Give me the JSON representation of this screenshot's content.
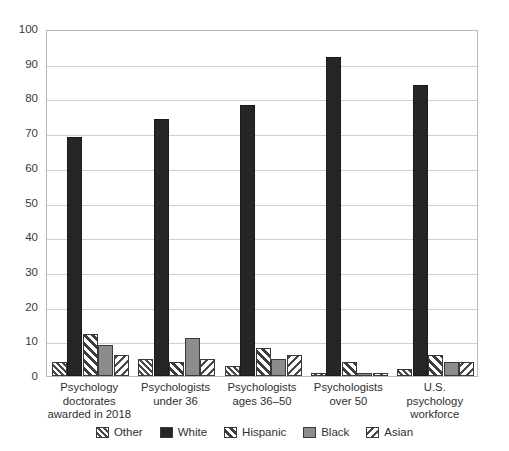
{
  "chart_data": {
    "type": "bar",
    "title": "",
    "subtitle": "",
    "xlabel": "",
    "ylabel": "",
    "ylim": [
      0,
      100
    ],
    "ytick_step": 10,
    "yticks": [
      "0",
      "10",
      "20",
      "30",
      "40",
      "50",
      "60",
      "70",
      "80",
      "90",
      "100"
    ],
    "grid": true,
    "legend_position": "bottom",
    "categories": [
      "Psychology\ndoctorates\nawarded in 2018",
      "Psychologists\nunder 36",
      "Psychologists\nages 36–50",
      "Psychologists\nover 50",
      "U.S.\npsychology\nworkforce"
    ],
    "series": [
      {
        "name": "Other",
        "pattern": "diagonal-hatch-forward",
        "color": "#9a9a9a",
        "values": [
          4,
          5,
          3,
          1,
          2
        ]
      },
      {
        "name": "White",
        "pattern": "solid-dark",
        "color": "#262626",
        "values": [
          69,
          74,
          78,
          92,
          84
        ]
      },
      {
        "name": "Hispanic",
        "pattern": "diagonal-hatch-forward-wide",
        "color": "#bdbdbd",
        "values": [
          12,
          4,
          8,
          4,
          6
        ]
      },
      {
        "name": "Black",
        "pattern": "solid-gray",
        "color": "#8c8c8c",
        "values": [
          9,
          11,
          5,
          1,
          4
        ]
      },
      {
        "name": "Asian",
        "pattern": "diagonal-hatch-back",
        "color": "#c9c9c9",
        "values": [
          6,
          5,
          6,
          1,
          4
        ]
      }
    ]
  },
  "legend": {
    "items": [
      {
        "label": "Other",
        "swatch": "hatch-forward-swatch"
      },
      {
        "label": "White",
        "swatch": "solid-dark-swatch"
      },
      {
        "label": "Hispanic",
        "swatch": "hatch-forward-wide-swatch"
      },
      {
        "label": "Black",
        "swatch": "solid-gray-swatch"
      },
      {
        "label": "Asian",
        "swatch": "hatch-back-swatch"
      }
    ]
  },
  "colors": {
    "axis": "#3a3a3a",
    "grid": "#cfcfcf",
    "frame": "#b9b9b9",
    "text": "#2f2f2f",
    "background": "#ffffff"
  }
}
